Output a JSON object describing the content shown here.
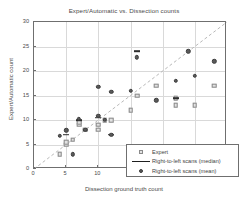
{
  "chart_data": {
    "type": "scatter",
    "title": "Expert/Automatic vs. Dissection counts",
    "xlabel": "Dissection ground truth count",
    "ylabel": "Expert/Automatic count",
    "xlim": [
      0,
      30
    ],
    "ylim": [
      0,
      30
    ],
    "xticks": [
      0,
      5,
      10,
      15,
      20,
      25,
      30
    ],
    "yticks": [
      0,
      5,
      10,
      15,
      20,
      25,
      30
    ],
    "grid": true,
    "legend_position": "lower-right",
    "reference_line": {
      "type": "identity",
      "label": "y = x",
      "style": "dashed"
    },
    "series": [
      {
        "name": "Expert",
        "marker": "square",
        "color": "#e2e2e2",
        "points": [
          {
            "x": 4,
            "y": 3
          },
          {
            "x": 5,
            "y": 5
          },
          {
            "x": 5,
            "y": 5.5
          },
          {
            "x": 6,
            "y": 6
          },
          {
            "x": 7,
            "y": 9
          },
          {
            "x": 7,
            "y": 9.5
          },
          {
            "x": 8,
            "y": 8
          },
          {
            "x": 10,
            "y": 8
          },
          {
            "x": 10,
            "y": 9
          },
          {
            "x": 11,
            "y": 10
          },
          {
            "x": 12,
            "y": 10
          },
          {
            "x": 15,
            "y": 12
          },
          {
            "x": 16,
            "y": 15
          },
          {
            "x": 19,
            "y": 17
          },
          {
            "x": 22,
            "y": 13
          },
          {
            "x": 22,
            "y": 14.5
          },
          {
            "x": 25,
            "y": 13
          },
          {
            "x": 28,
            "y": 17
          }
        ]
      },
      {
        "name": "Right-to-left scans (median)",
        "marker": "line",
        "color": "#2e2e2e",
        "points": [
          {
            "x": 5,
            "y": 7
          },
          {
            "x": 7,
            "y": 10
          },
          {
            "x": 10,
            "y": 10.5
          },
          {
            "x": 12,
            "y": 7
          },
          {
            "x": 16,
            "y": 24
          },
          {
            "x": 22,
            "y": 14.5
          }
        ]
      },
      {
        "name": "Right-to-left scans (mean)",
        "marker": "circle",
        "color": "#5a5a5a",
        "points": [
          {
            "x": 4,
            "y": 6.8
          },
          {
            "x": 5,
            "y": 7.9
          },
          {
            "x": 6,
            "y": 3
          },
          {
            "x": 7,
            "y": 10.2
          },
          {
            "x": 8,
            "y": 8
          },
          {
            "x": 10,
            "y": 16.8
          },
          {
            "x": 10,
            "y": 10.9
          },
          {
            "x": 11,
            "y": 10
          },
          {
            "x": 12,
            "y": 15.8
          },
          {
            "x": 12,
            "y": 7
          },
          {
            "x": 15,
            "y": 15.9
          },
          {
            "x": 16,
            "y": 22.8
          },
          {
            "x": 19,
            "y": 14
          },
          {
            "x": 22,
            "y": 18
          },
          {
            "x": 24,
            "y": 24
          },
          {
            "x": 25,
            "y": 19
          },
          {
            "x": 28,
            "y": 22
          }
        ]
      }
    ]
  },
  "legend": {
    "items": [
      {
        "label": "Expert",
        "symbol": "square-marker"
      },
      {
        "label": "Right-to-left scans (median)",
        "symbol": "line-marker"
      },
      {
        "label": "Right-to-left scans (mean)",
        "symbol": "circle-marker"
      }
    ]
  }
}
